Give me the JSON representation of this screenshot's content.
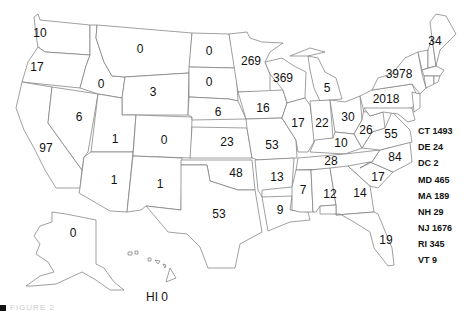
{
  "map": {
    "states": [
      {
        "abbr": "WA",
        "value": "10",
        "x": 40,
        "y": 33
      },
      {
        "abbr": "OR",
        "value": "17",
        "x": 37,
        "y": 67
      },
      {
        "abbr": "ID",
        "value": "0",
        "x": 101,
        "y": 84
      },
      {
        "abbr": "MT",
        "value": "0",
        "x": 140,
        "y": 49
      },
      {
        "abbr": "WY",
        "value": "3",
        "x": 153,
        "y": 92
      },
      {
        "abbr": "ND",
        "value": "0",
        "x": 209,
        "y": 51
      },
      {
        "abbr": "SD",
        "value": "0",
        "x": 209,
        "y": 82
      },
      {
        "abbr": "MN",
        "value": "269",
        "x": 251,
        "y": 61
      },
      {
        "abbr": "WI",
        "value": "369",
        "x": 283,
        "y": 78
      },
      {
        "abbr": "MI",
        "value": "5",
        "x": 327,
        "y": 88
      },
      {
        "abbr": "NY",
        "value": "3978",
        "x": 399,
        "y": 74
      },
      {
        "abbr": "ME",
        "value": "34",
        "x": 435,
        "y": 41
      },
      {
        "abbr": "PA",
        "value": "2018",
        "x": 386,
        "y": 99
      },
      {
        "abbr": "NV",
        "value": "6",
        "x": 79,
        "y": 117
      },
      {
        "abbr": "CA",
        "value": "97",
        "x": 46,
        "y": 148
      },
      {
        "abbr": "UT",
        "value": "1",
        "x": 115,
        "y": 139
      },
      {
        "abbr": "CO",
        "value": "0",
        "x": 164,
        "y": 140
      },
      {
        "abbr": "NE",
        "value": "6",
        "x": 218,
        "y": 112
      },
      {
        "abbr": "IA",
        "value": "16",
        "x": 263,
        "y": 108
      },
      {
        "abbr": "IL",
        "value": "17",
        "x": 298,
        "y": 123
      },
      {
        "abbr": "IN",
        "value": "22",
        "x": 322,
        "y": 123
      },
      {
        "abbr": "OH",
        "value": "30",
        "x": 348,
        "y": 117
      },
      {
        "abbr": "WV",
        "value": "26",
        "x": 366,
        "y": 130
      },
      {
        "abbr": "VA",
        "value": "55",
        "x": 391,
        "y": 134
      },
      {
        "abbr": "KY",
        "value": "10",
        "x": 341,
        "y": 143
      },
      {
        "abbr": "KS",
        "value": "23",
        "x": 227,
        "y": 142
      },
      {
        "abbr": "MO",
        "value": "53",
        "x": 272,
        "y": 145
      },
      {
        "abbr": "AZ",
        "value": "1",
        "x": 114,
        "y": 180
      },
      {
        "abbr": "NM",
        "value": "1",
        "x": 160,
        "y": 184
      },
      {
        "abbr": "OK",
        "value": "48",
        "x": 236,
        "y": 173
      },
      {
        "abbr": "AR",
        "value": "13",
        "x": 277,
        "y": 177
      },
      {
        "abbr": "TN",
        "value": "28",
        "x": 331,
        "y": 161
      },
      {
        "abbr": "NC",
        "value": "84",
        "x": 395,
        "y": 157
      },
      {
        "abbr": "SC",
        "value": "17",
        "x": 378,
        "y": 177
      },
      {
        "abbr": "TX",
        "value": "53",
        "x": 219,
        "y": 214
      },
      {
        "abbr": "LA",
        "value": "9",
        "x": 280,
        "y": 210
      },
      {
        "abbr": "MS",
        "value": "7",
        "x": 303,
        "y": 190
      },
      {
        "abbr": "AL",
        "value": "12",
        "x": 330,
        "y": 194
      },
      {
        "abbr": "GA",
        "value": "14",
        "x": 360,
        "y": 193
      },
      {
        "abbr": "FL",
        "value": "19",
        "x": 386,
        "y": 240
      },
      {
        "abbr": "AK",
        "value": "0",
        "x": 73,
        "y": 233
      },
      {
        "abbr": "HI",
        "value": "HI 0",
        "x": 157,
        "y": 297
      }
    ],
    "side_labels": [
      {
        "text": "CT 1493",
        "y": 132
      },
      {
        "text": "DE 24",
        "y": 148
      },
      {
        "text": "DC 2",
        "y": 164
      },
      {
        "text": "MD 465",
        "y": 181
      },
      {
        "text": "MA 189",
        "y": 197
      },
      {
        "text": "NH 29",
        "y": 213
      },
      {
        "text": "NJ 1676",
        "y": 229
      },
      {
        "text": "RI 345",
        "y": 245
      },
      {
        "text": "VT 9",
        "y": 261
      }
    ],
    "footer": {
      "caption": "FIGURE 2"
    }
  }
}
